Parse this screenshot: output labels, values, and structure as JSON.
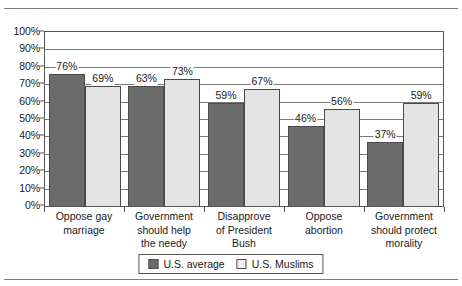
{
  "chart_data": {
    "type": "bar",
    "title": "",
    "xlabel": "",
    "ylabel": "",
    "ylim": [
      0,
      100
    ],
    "grid": true,
    "legend_position": "bottom-center",
    "categories": [
      "Oppose gay marriage",
      "Government should help the needy",
      "Disapprove of President Bush",
      "Oppose abortion",
      "Government should protect morality"
    ],
    "category_lines": [
      [
        "Oppose gay",
        "marriage"
      ],
      [
        "Government",
        "should help",
        "the needy"
      ],
      [
        "Disapprove",
        "of President",
        "Bush"
      ],
      [
        "Oppose",
        "abortion"
      ],
      [
        "Government",
        "should protect",
        "morality"
      ]
    ],
    "series": [
      {
        "name": "U.S. average",
        "color": "#6b6b6b",
        "values": [
          76,
          69,
          59,
          46,
          37
        ],
        "labels": [
          "76%",
          "63%",
          "59%",
          "46%",
          "37%"
        ]
      },
      {
        "name": "U.S. Muslims",
        "color": "#e3e3e3",
        "values": [
          69,
          73,
          67,
          56,
          59
        ],
        "labels": [
          "69%",
          "73%",
          "67%",
          "56%",
          "59%"
        ]
      }
    ],
    "bars": [
      {
        "category_index": 0,
        "series": "U.S. average",
        "value": 76,
        "label": "76%"
      },
      {
        "category_index": 0,
        "series": "U.S. Muslims",
        "value": 69,
        "label": "69%"
      },
      {
        "category_index": 1,
        "series": "U.S. average",
        "value": 63,
        "label": "63%"
      },
      {
        "category_index": 1,
        "series": "U.S. Muslims",
        "value": 73,
        "label": "73%"
      },
      {
        "category_index": 2,
        "series": "U.S. average",
        "value": 59,
        "label": "59%"
      },
      {
        "category_index": 2,
        "series": "U.S. Muslims",
        "value": 67,
        "label": "67%"
      },
      {
        "category_index": 3,
        "series": "U.S. average",
        "value": 46,
        "label": "46%"
      },
      {
        "category_index": 3,
        "series": "U.S. Muslims",
        "value": 56,
        "label": "56%"
      },
      {
        "category_index": 4,
        "series": "U.S. average",
        "value": 37,
        "label": "37%"
      },
      {
        "category_index": 4,
        "series": "U.S. Muslims",
        "value": 59,
        "label": "59%"
      }
    ],
    "y_ticks": [
      "0%",
      "10%",
      "20%",
      "30%",
      "40%",
      "50%",
      "60%",
      "70%",
      "80%",
      "90%",
      "100%"
    ]
  },
  "axis": {
    "y_ticks": [
      {
        "label": "100%",
        "value": 100
      },
      {
        "label": "90%",
        "value": 90
      },
      {
        "label": "80%",
        "value": 80
      },
      {
        "label": "70%",
        "value": 70
      },
      {
        "label": "60%",
        "value": 60
      },
      {
        "label": "50%",
        "value": 50
      },
      {
        "label": "40%",
        "value": 40
      },
      {
        "label": "30%",
        "value": 30
      },
      {
        "label": "20%",
        "value": 20
      },
      {
        "label": "10%",
        "value": 10
      },
      {
        "label": "0%",
        "value": 0
      }
    ]
  },
  "legend": {
    "items": [
      {
        "label": "U.S. average",
        "color": "#6b6b6b"
      },
      {
        "label": "U.S. Muslims",
        "color": "#f2f2f2"
      }
    ]
  }
}
